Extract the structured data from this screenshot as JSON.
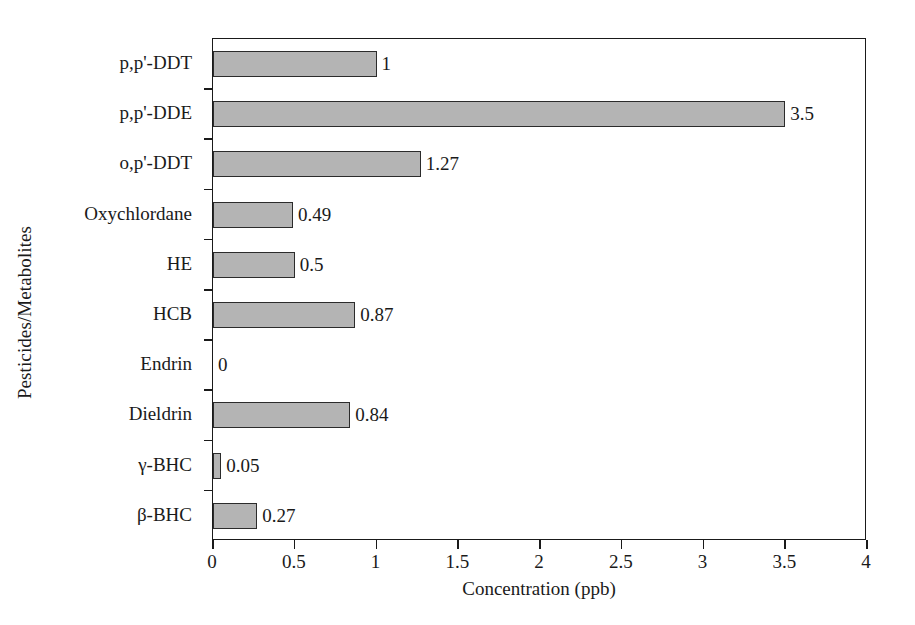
{
  "chart_data": {
    "type": "bar",
    "orientation": "horizontal",
    "title": "",
    "xlabel": "Concentration (ppb)",
    "ylabel": "Pesticides/Metabolites",
    "categories": [
      "p,p'-DDT",
      "p,p'-DDE",
      "o,p'-DDT",
      "Oxychlordane",
      "HE",
      "HCB",
      "Endrin",
      "Dieldrin",
      "γ-BHC",
      "β-BHC"
    ],
    "values": [
      1,
      3.5,
      1.27,
      0.49,
      0.5,
      0.87,
      0,
      0.84,
      0.05,
      0.27
    ],
    "value_labels": [
      "1",
      "3.5",
      "1.27",
      "0.49",
      "0.5",
      "0.87",
      "0",
      "0.84",
      "0.05",
      "0.27"
    ],
    "xlim": [
      0,
      4
    ],
    "xticks": [
      0,
      0.5,
      1,
      1.5,
      2,
      2.5,
      3,
      3.5,
      4
    ],
    "xtick_labels": [
      "0",
      "0.5",
      "1",
      "1.5",
      "2",
      "2.5",
      "3",
      "3.5",
      "4"
    ],
    "grid": false,
    "legend": null,
    "bar_color": "#b4b4b4",
    "bar_edge_color": "#2b2b2b",
    "axis_color": "#1a1a1a",
    "background": "#ffffff"
  }
}
